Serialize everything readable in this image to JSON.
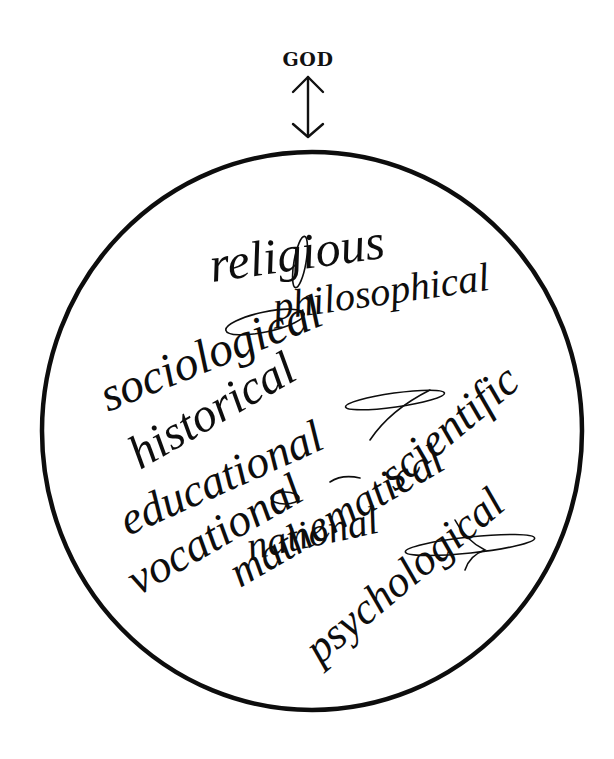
{
  "diagram": {
    "top_label": "GOD",
    "arrow": {
      "type": "double-headed-vertical",
      "connects": [
        "GOD",
        "circle"
      ]
    },
    "circle": {
      "cx": 312,
      "cy": 431,
      "rx": 270,
      "ry": 279,
      "stroke": "#0d0d0d"
    },
    "words": [
      {
        "id": "religious",
        "text": "religious",
        "x": 212,
        "y": 282,
        "size": 50,
        "rotate": -8
      },
      {
        "id": "sociological",
        "text": "sociological",
        "x": 108,
        "y": 415,
        "size": 48,
        "rotate": -25
      },
      {
        "id": "historical",
        "text": "historical",
        "x": 140,
        "y": 470,
        "size": 48,
        "rotate": -30
      },
      {
        "id": "philosophical",
        "text": "philosophical",
        "x": 285,
        "y": 330,
        "size": 40,
        "rotate": -10
      },
      {
        "id": "educational",
        "text": "educational",
        "x": 125,
        "y": 538,
        "size": 46,
        "rotate": -24
      },
      {
        "id": "vocational",
        "text": "vocational",
        "x": 135,
        "y": 595,
        "size": 46,
        "rotate": -30
      },
      {
        "id": "mathematical",
        "text": "mathematical",
        "x": 238,
        "y": 588,
        "size": 46,
        "rotate": -32
      },
      {
        "id": "scientific",
        "text": "scientific",
        "x": 400,
        "y": 490,
        "size": 46,
        "rotate": -38
      },
      {
        "id": "national",
        "text": "national",
        "x": 240,
        "y": 565,
        "size": 40,
        "rotate": -14
      },
      {
        "id": "psychological",
        "text": "psychological",
        "x": 318,
        "y": 665,
        "size": 46,
        "rotate": -40
      }
    ]
  }
}
